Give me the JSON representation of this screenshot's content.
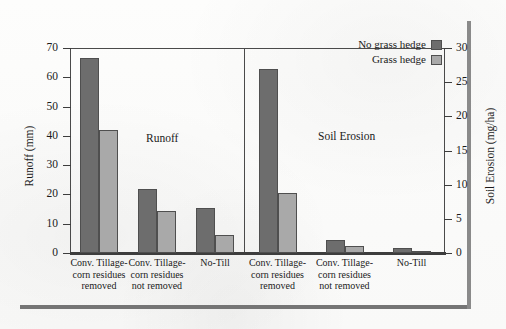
{
  "figure": {
    "panels": [
      {
        "id": "runoff",
        "caption": "Runoff"
      },
      {
        "id": "soil-erosion",
        "caption": "Soil Erosion"
      }
    ],
    "legend": {
      "entries": [
        {
          "label": "No grass hedge",
          "color": "#6d6d6d",
          "swatch": "dark"
        },
        {
          "label": "Grass hedge",
          "color": "#a9a9a9",
          "swatch": "light"
        }
      ]
    },
    "axes": {
      "left": {
        "title": "Runoff (mm)",
        "ticks": [
          "0",
          "10",
          "20",
          "30",
          "40",
          "50",
          "60",
          "70"
        ]
      },
      "right": {
        "title": "Soil Erosion (mg/ha)",
        "ticks": [
          "0",
          "5",
          "10",
          "15",
          "20",
          "25",
          "30"
        ]
      }
    },
    "categories": [
      "Conv. Tillage-corn residues removed",
      "Conv. Tillage-corn residues not removed",
      "No-Till"
    ],
    "category_lines": [
      [
        "Conv. Tillage-",
        "corn residues",
        "removed"
      ],
      [
        "Conv. Tillage-",
        "corn residues",
        "not removed"
      ],
      [
        "No-Till"
      ]
    ]
  },
  "chart_data": {
    "type": "bar",
    "title": "",
    "panels": [
      {
        "name": "Runoff",
        "ylabel": "Runoff (mm)",
        "ylim": [
          0,
          70
        ],
        "ytick_step": 10,
        "unit": "mm",
        "categories": [
          "Conv. Tillage-corn residues removed",
          "Conv. Tillage-corn residues not removed",
          "No-Till"
        ],
        "series": [
          {
            "name": "No grass hedge",
            "color": "#6d6d6d",
            "values": [
              66.5,
              21.8,
              15.3
            ]
          },
          {
            "name": "Grass hedge",
            "color": "#a9a9a9",
            "values": [
              42.1,
              14.3,
              6.2
            ]
          }
        ]
      },
      {
        "name": "Soil Erosion",
        "ylabel": "Soil Erosion (mg/ha)",
        "ylim": [
          0,
          30
        ],
        "ytick_step": 5,
        "unit": "mg/ha",
        "categories": [
          "Conv. Tillage-corn residues removed",
          "Conv. Tillage-corn residues not removed",
          "No-Till"
        ],
        "series": [
          {
            "name": "No grass hedge",
            "color": "#6d6d6d",
            "values": [
              26.9,
              1.9,
              0.8
            ]
          },
          {
            "name": "Grass hedge",
            "color": "#a9a9a9",
            "values": [
              8.8,
              1.0,
              0.25
            ]
          }
        ]
      }
    ],
    "legend_position": "top-right",
    "grid": false
  }
}
